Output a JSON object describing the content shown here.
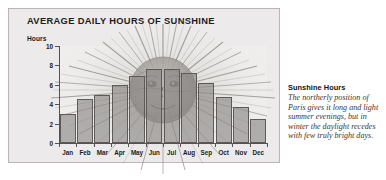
{
  "chart_panel": {
    "title": "AVERAGE DAILY HOURS OF SUNSHINE",
    "y_axis_unit": "Hours",
    "background_color": "#eceaea",
    "border_color": "#b9b6b4",
    "bar_color": "#888582",
    "bar_outline_color": "#5d5a57",
    "axis_color": "#55524f",
    "illustration": "sun-face-with-rays"
  },
  "chart_data": {
    "type": "bar",
    "title": "AVERAGE DAILY HOURS OF SUNSHINE",
    "xlabel": "",
    "ylabel": "Hours",
    "ylim": [
      0,
      10
    ],
    "yticks": [
      0,
      2,
      4,
      6,
      8,
      10
    ],
    "grid": false,
    "legend": "none",
    "categories": [
      "Jan",
      "Feb",
      "Mar",
      "Apr",
      "May",
      "Jun",
      "Jul",
      "Aug",
      "Sep",
      "Oct",
      "Nov",
      "Dec"
    ],
    "values": [
      3.0,
      4.5,
      5.0,
      6.0,
      6.9,
      7.6,
      7.6,
      7.2,
      6.2,
      4.7,
      3.7,
      2.5
    ]
  },
  "caption": {
    "heading": "Sunshine Hours",
    "body": "The northerly position of Paris gives it long and light summer evenings, but in winter the daylight recedes with few truly bright days."
  }
}
